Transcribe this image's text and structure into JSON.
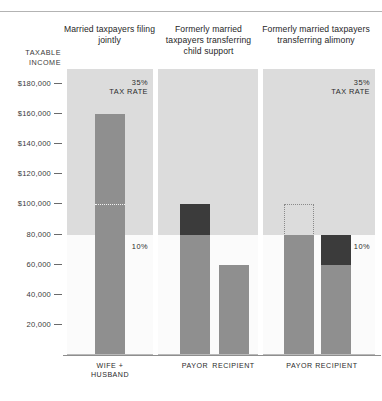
{
  "axis": {
    "title_line1": "TAXABLE",
    "title_line2": "INCOME",
    "ticks": [
      {
        "label": "$180,000",
        "value": 180000
      },
      {
        "label": "$160,000",
        "value": 160000
      },
      {
        "label": "$140,000",
        "value": 140000
      },
      {
        "label": "$120,000",
        "value": 120000
      },
      {
        "label": "$100,000",
        "value": 100000
      },
      {
        "label": "80,000",
        "value": 80000
      },
      {
        "label": "60,000",
        "value": 60000
      },
      {
        "label": "40,000",
        "value": 40000
      },
      {
        "label": "20,000",
        "value": 20000
      }
    ]
  },
  "panels": [
    {
      "heading": "Married taxpayers filing jointly",
      "rate_high_pct": "35%",
      "rate_high_text": "TAX RATE",
      "rate_low_pct": "10%",
      "categories": [
        "WIFE + HUSBAND"
      ]
    },
    {
      "heading": "Formerly married taxpayers transferring child support",
      "rate_high_pct": "",
      "rate_high_text": "",
      "rate_low_pct": "",
      "categories": [
        "PAYOR",
        "RECIPIENT"
      ]
    },
    {
      "heading": "Formerly married taxpayers transferring alimony",
      "rate_high_pct": "35%",
      "rate_high_text": "TAX RATE",
      "rate_low_pct": "10%",
      "categories": [
        "PAYOR",
        "RECIPIENT"
      ]
    }
  ],
  "chart_data": {
    "type": "bar",
    "title": "",
    "xlabel": "",
    "ylabel": "TAXABLE INCOME",
    "ylim": [
      0,
      190000
    ],
    "grid": false,
    "legend": "none",
    "bracket_threshold": 80000,
    "bracket_high_label": "35% TAX RATE",
    "bracket_low_label": "10%",
    "colors": {
      "bar": "#8f8f8f",
      "bar_taxed_high": "#3b3b3b",
      "band_high": "#dcdcdc",
      "panel_bg": "#fbfbfb"
    },
    "panels": [
      {
        "name": "Married taxpayers filing jointly",
        "bars": [
          {
            "category": "WIFE + HUSBAND",
            "total": 160000,
            "light_segment": [
              0,
              160000
            ],
            "dark_segment": null,
            "split_marker": 100000,
            "ghost_outline": null
          }
        ]
      },
      {
        "name": "Formerly married taxpayers transferring child support",
        "bars": [
          {
            "category": "PAYOR",
            "total": 100000,
            "light_segment": [
              0,
              80000
            ],
            "dark_segment": [
              80000,
              100000
            ],
            "split_marker": null,
            "ghost_outline": null
          },
          {
            "category": "RECIPIENT",
            "total": 60000,
            "light_segment": [
              0,
              60000
            ],
            "dark_segment": null,
            "split_marker": null,
            "ghost_outline": null
          }
        ]
      },
      {
        "name": "Formerly married taxpayers transferring alimony",
        "bars": [
          {
            "category": "PAYOR",
            "total": 80000,
            "light_segment": [
              0,
              80000
            ],
            "dark_segment": null,
            "split_marker": null,
            "ghost_outline": [
              80000,
              100000
            ]
          },
          {
            "category": "RECIPIENT",
            "total": 80000,
            "light_segment": [
              0,
              60000
            ],
            "dark_segment": [
              60000,
              80000
            ],
            "split_marker": null,
            "ghost_outline": null
          }
        ]
      }
    ]
  }
}
